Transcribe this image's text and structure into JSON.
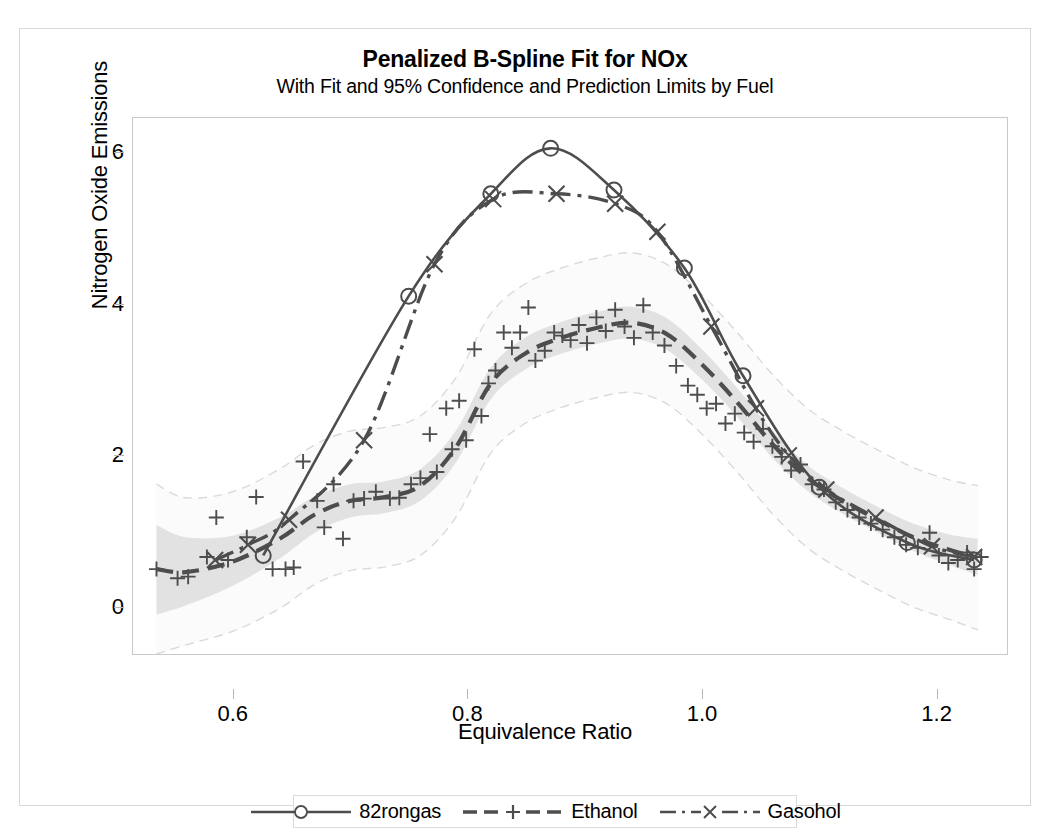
{
  "chart_data": {
    "type": "line",
    "title": "Penalized B-Spline Fit for NOx",
    "subtitle": "With Fit and 95% Confidence and Prediction Limits by Fuel",
    "xlabel": "Equivalence Ratio",
    "ylabel": "Nitrogen Oxide Emissions",
    "xlim": [
      0.515,
      1.26
    ],
    "ylim": [
      -0.62,
      6.45
    ],
    "xticks": [
      0.6,
      0.8,
      1.0,
      1.2
    ],
    "xtick_labels": [
      "0.6",
      "0.8",
      "1.0",
      "1.2"
    ],
    "yticks": [
      0,
      2,
      4,
      6
    ],
    "ytick_labels": [
      "0",
      "2",
      "4",
      "6"
    ],
    "grid": false,
    "legend_position": "bottom",
    "series": [
      {
        "name": "82rongas",
        "marker": "circle",
        "line_style": "solid",
        "color": "#595959",
        "points": [
          {
            "x": 0.626,
            "y": 0.68
          },
          {
            "x": 0.75,
            "y": 4.1
          },
          {
            "x": 0.82,
            "y": 5.45
          },
          {
            "x": 0.871,
            "y": 6.05
          },
          {
            "x": 0.925,
            "y": 5.5
          },
          {
            "x": 0.985,
            "y": 4.47
          },
          {
            "x": 1.035,
            "y": 3.05
          },
          {
            "x": 1.1,
            "y": 1.58
          },
          {
            "x": 1.175,
            "y": 0.85
          },
          {
            "x": 1.232,
            "y": 0.62
          }
        ]
      },
      {
        "name": "Ethanol",
        "marker": "plus",
        "line_style": "dashed",
        "color": "#595959",
        "fit_points": [
          {
            "x": 0.535,
            "y": 0.5
          },
          {
            "x": 0.56,
            "y": 0.46
          },
          {
            "x": 0.6,
            "y": 0.6
          },
          {
            "x": 0.64,
            "y": 0.9
          },
          {
            "x": 0.67,
            "y": 1.22
          },
          {
            "x": 0.7,
            "y": 1.4
          },
          {
            "x": 0.73,
            "y": 1.45
          },
          {
            "x": 0.76,
            "y": 1.6
          },
          {
            "x": 0.79,
            "y": 2.1
          },
          {
            "x": 0.82,
            "y": 2.95
          },
          {
            "x": 0.85,
            "y": 3.35
          },
          {
            "x": 0.88,
            "y": 3.55
          },
          {
            "x": 0.91,
            "y": 3.68
          },
          {
            "x": 0.94,
            "y": 3.75
          },
          {
            "x": 0.97,
            "y": 3.6
          },
          {
            "x": 1.0,
            "y": 3.2
          },
          {
            "x": 1.03,
            "y": 2.7
          },
          {
            "x": 1.06,
            "y": 2.15
          },
          {
            "x": 1.09,
            "y": 1.7
          },
          {
            "x": 1.12,
            "y": 1.4
          },
          {
            "x": 1.15,
            "y": 1.15
          },
          {
            "x": 1.18,
            "y": 0.92
          },
          {
            "x": 1.21,
            "y": 0.76
          },
          {
            "x": 1.235,
            "y": 0.65
          }
        ],
        "scatter": [
          {
            "x": 0.535,
            "y": 0.5
          },
          {
            "x": 0.553,
            "y": 0.38
          },
          {
            "x": 0.562,
            "y": 0.4
          },
          {
            "x": 0.578,
            "y": 0.66
          },
          {
            "x": 0.586,
            "y": 1.18
          },
          {
            "x": 0.596,
            "y": 0.62
          },
          {
            "x": 0.612,
            "y": 0.92
          },
          {
            "x": 0.62,
            "y": 1.45
          },
          {
            "x": 0.634,
            "y": 0.5
          },
          {
            "x": 0.645,
            "y": 0.5
          },
          {
            "x": 0.652,
            "y": 0.52
          },
          {
            "x": 0.66,
            "y": 1.92
          },
          {
            "x": 0.672,
            "y": 1.4
          },
          {
            "x": 0.678,
            "y": 1.05
          },
          {
            "x": 0.686,
            "y": 1.62
          },
          {
            "x": 0.694,
            "y": 0.9
          },
          {
            "x": 0.703,
            "y": 1.4
          },
          {
            "x": 0.712,
            "y": 1.43
          },
          {
            "x": 0.722,
            "y": 1.52
          },
          {
            "x": 0.734,
            "y": 1.43
          },
          {
            "x": 0.742,
            "y": 1.44
          },
          {
            "x": 0.752,
            "y": 1.62
          },
          {
            "x": 0.76,
            "y": 1.7
          },
          {
            "x": 0.768,
            "y": 2.28
          },
          {
            "x": 0.774,
            "y": 1.78
          },
          {
            "x": 0.782,
            "y": 2.62
          },
          {
            "x": 0.787,
            "y": 2.08
          },
          {
            "x": 0.793,
            "y": 2.72
          },
          {
            "x": 0.799,
            "y": 2.2
          },
          {
            "x": 0.806,
            "y": 3.4
          },
          {
            "x": 0.812,
            "y": 2.52
          },
          {
            "x": 0.818,
            "y": 2.95
          },
          {
            "x": 0.824,
            "y": 3.12
          },
          {
            "x": 0.831,
            "y": 3.62
          },
          {
            "x": 0.838,
            "y": 3.42
          },
          {
            "x": 0.845,
            "y": 3.62
          },
          {
            "x": 0.852,
            "y": 3.95
          },
          {
            "x": 0.858,
            "y": 3.25
          },
          {
            "x": 0.866,
            "y": 3.38
          },
          {
            "x": 0.874,
            "y": 3.62
          },
          {
            "x": 0.881,
            "y": 3.58
          },
          {
            "x": 0.888,
            "y": 3.52
          },
          {
            "x": 0.895,
            "y": 3.72
          },
          {
            "x": 0.902,
            "y": 3.48
          },
          {
            "x": 0.91,
            "y": 3.82
          },
          {
            "x": 0.918,
            "y": 3.64
          },
          {
            "x": 0.926,
            "y": 3.92
          },
          {
            "x": 0.934,
            "y": 3.7
          },
          {
            "x": 0.942,
            "y": 3.55
          },
          {
            "x": 0.95,
            "y": 3.98
          },
          {
            "x": 0.958,
            "y": 3.62
          },
          {
            "x": 0.968,
            "y": 3.45
          },
          {
            "x": 0.978,
            "y": 3.18
          },
          {
            "x": 0.988,
            "y": 2.92
          },
          {
            "x": 0.996,
            "y": 2.8
          },
          {
            "x": 1.004,
            "y": 2.62
          },
          {
            "x": 1.012,
            "y": 2.68
          },
          {
            "x": 1.02,
            "y": 2.42
          },
          {
            "x": 1.028,
            "y": 2.55
          },
          {
            "x": 1.036,
            "y": 2.3
          },
          {
            "x": 1.044,
            "y": 2.18
          },
          {
            "x": 1.052,
            "y": 2.35
          },
          {
            "x": 1.06,
            "y": 2.12
          },
          {
            "x": 1.068,
            "y": 1.98
          },
          {
            "x": 1.076,
            "y": 1.8
          },
          {
            "x": 1.084,
            "y": 1.88
          },
          {
            "x": 1.094,
            "y": 1.62
          },
          {
            "x": 1.104,
            "y": 1.55
          },
          {
            "x": 1.114,
            "y": 1.38
          },
          {
            "x": 1.124,
            "y": 1.28
          },
          {
            "x": 1.134,
            "y": 1.18
          },
          {
            "x": 1.144,
            "y": 1.1
          },
          {
            "x": 1.154,
            "y": 1.02
          },
          {
            "x": 1.164,
            "y": 0.92
          },
          {
            "x": 1.174,
            "y": 0.82
          },
          {
            "x": 1.184,
            "y": 0.78
          },
          {
            "x": 1.194,
            "y": 0.98
          },
          {
            "x": 1.202,
            "y": 0.68
          },
          {
            "x": 1.21,
            "y": 0.58
          },
          {
            "x": 1.218,
            "y": 0.62
          },
          {
            "x": 1.226,
            "y": 0.72
          },
          {
            "x": 1.232,
            "y": 0.5
          },
          {
            "x": 1.238,
            "y": 0.66
          }
        ]
      },
      {
        "name": "Gasohol",
        "marker": "x",
        "line_style": "dash-dot",
        "color": "#595959",
        "points": [
          {
            "x": 0.585,
            "y": 0.62
          },
          {
            "x": 0.613,
            "y": 0.82
          },
          {
            "x": 0.648,
            "y": 1.15
          },
          {
            "x": 0.712,
            "y": 2.2
          },
          {
            "x": 0.772,
            "y": 4.52
          },
          {
            "x": 0.822,
            "y": 5.38
          },
          {
            "x": 0.876,
            "y": 5.45
          },
          {
            "x": 0.926,
            "y": 5.32
          },
          {
            "x": 0.962,
            "y": 4.95
          },
          {
            "x": 1.008,
            "y": 3.7
          },
          {
            "x": 1.046,
            "y": 2.62
          },
          {
            "x": 1.074,
            "y": 2.0
          },
          {
            "x": 1.106,
            "y": 1.55
          },
          {
            "x": 1.148,
            "y": 1.18
          },
          {
            "x": 1.196,
            "y": 0.8
          },
          {
            "x": 1.232,
            "y": 0.66
          }
        ]
      }
    ],
    "bands": {
      "confidence_label": "95% Confidence Limits",
      "prediction_label": "95% Prediction Limits",
      "confidence_color": "#e0e0e0",
      "prediction_color": "#e8e8e8",
      "confidence": [
        {
          "x": 0.535,
          "lo": -0.1,
          "hi": 1.08
        },
        {
          "x": 0.56,
          "lo": 0.02,
          "hi": 0.92
        },
        {
          "x": 0.6,
          "lo": 0.28,
          "hi": 0.94
        },
        {
          "x": 0.64,
          "lo": 0.64,
          "hi": 1.18
        },
        {
          "x": 0.67,
          "lo": 0.98,
          "hi": 1.46
        },
        {
          "x": 0.7,
          "lo": 1.18,
          "hi": 1.62
        },
        {
          "x": 0.73,
          "lo": 1.24,
          "hi": 1.66
        },
        {
          "x": 0.76,
          "lo": 1.4,
          "hi": 1.82
        },
        {
          "x": 0.79,
          "lo": 1.9,
          "hi": 2.32
        },
        {
          "x": 0.82,
          "lo": 2.74,
          "hi": 3.16
        },
        {
          "x": 0.85,
          "lo": 3.14,
          "hi": 3.56
        },
        {
          "x": 0.88,
          "lo": 3.34,
          "hi": 3.76
        },
        {
          "x": 0.91,
          "lo": 3.47,
          "hi": 3.89
        },
        {
          "x": 0.94,
          "lo": 3.54,
          "hi": 3.96
        },
        {
          "x": 0.97,
          "lo": 3.39,
          "hi": 3.81
        },
        {
          "x": 1.0,
          "lo": 3.0,
          "hi": 3.4
        },
        {
          "x": 1.03,
          "lo": 2.51,
          "hi": 2.89
        },
        {
          "x": 1.06,
          "lo": 1.97,
          "hi": 2.33
        },
        {
          "x": 1.09,
          "lo": 1.53,
          "hi": 1.87
        },
        {
          "x": 1.12,
          "lo": 1.23,
          "hi": 1.57
        },
        {
          "x": 1.15,
          "lo": 0.98,
          "hi": 1.32
        },
        {
          "x": 1.18,
          "lo": 0.74,
          "hi": 1.1
        },
        {
          "x": 1.21,
          "lo": 0.56,
          "hi": 0.96
        },
        {
          "x": 1.235,
          "lo": 0.42,
          "hi": 0.9
        }
      ],
      "prediction": [
        {
          "x": 0.535,
          "lo": -0.62,
          "hi": 1.62
        },
        {
          "x": 0.56,
          "lo": -0.5,
          "hi": 1.44
        },
        {
          "x": 0.6,
          "lo": -0.32,
          "hi": 1.52
        },
        {
          "x": 0.64,
          "lo": -0.02,
          "hi": 1.82
        },
        {
          "x": 0.67,
          "lo": 0.3,
          "hi": 2.14
        },
        {
          "x": 0.7,
          "lo": 0.48,
          "hi": 2.32
        },
        {
          "x": 0.73,
          "lo": 0.53,
          "hi": 2.37
        },
        {
          "x": 0.76,
          "lo": 0.68,
          "hi": 2.52
        },
        {
          "x": 0.79,
          "lo": 1.18,
          "hi": 3.02
        },
        {
          "x": 0.82,
          "lo": 2.03,
          "hi": 3.87
        },
        {
          "x": 0.85,
          "lo": 2.43,
          "hi": 4.27
        },
        {
          "x": 0.88,
          "lo": 2.63,
          "hi": 4.47
        },
        {
          "x": 0.91,
          "lo": 2.76,
          "hi": 4.6
        },
        {
          "x": 0.94,
          "lo": 2.83,
          "hi": 4.67
        },
        {
          "x": 0.97,
          "lo": 2.68,
          "hi": 4.52
        },
        {
          "x": 1.0,
          "lo": 2.28,
          "hi": 4.12
        },
        {
          "x": 1.03,
          "lo": 1.78,
          "hi": 3.62
        },
        {
          "x": 1.06,
          "lo": 1.23,
          "hi": 3.07
        },
        {
          "x": 1.09,
          "lo": 0.78,
          "hi": 2.62
        },
        {
          "x": 1.12,
          "lo": 0.48,
          "hi": 2.32
        },
        {
          "x": 1.15,
          "lo": 0.23,
          "hi": 2.07
        },
        {
          "x": 1.18,
          "lo": 0.0,
          "hi": 1.84
        },
        {
          "x": 1.21,
          "lo": -0.16,
          "hi": 1.68
        },
        {
          "x": 1.235,
          "lo": -0.3,
          "hi": 1.6
        }
      ]
    },
    "legend": [
      {
        "label": "82rongas",
        "marker": "circle",
        "line_style": "solid"
      },
      {
        "label": "Ethanol",
        "marker": "plus",
        "line_style": "dashed"
      },
      {
        "label": "Gasohol",
        "marker": "x",
        "line_style": "dash-dot"
      }
    ]
  }
}
